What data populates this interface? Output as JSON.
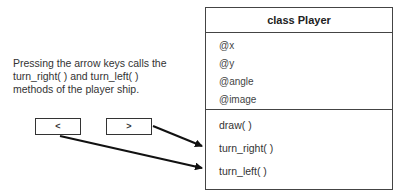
{
  "caption": {
    "lines": [
      "Pressing the arrow keys calls the",
      "turn_right( ) and turn_left( )",
      "methods of the player ship."
    ]
  },
  "keys": {
    "left": "<",
    "right": ">"
  },
  "uml_class": {
    "title": "class Player",
    "attributes": [
      "@x",
      "@y",
      "@angle",
      "@image"
    ],
    "methods": [
      "draw( )",
      "turn_right( )",
      "turn_left( )"
    ]
  },
  "arrows": [
    {
      "from": "right-key",
      "to": "turn_right( )"
    },
    {
      "from": "left-key",
      "to": "turn_left( )"
    }
  ],
  "colors": {
    "line": "#111111",
    "border": "#444444",
    "text": "#333333"
  }
}
